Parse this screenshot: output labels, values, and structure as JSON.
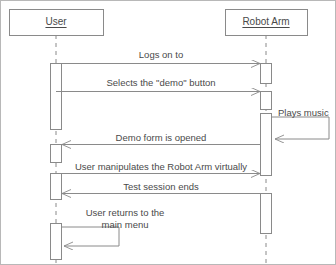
{
  "diagram": {
    "type": "uml-sequence-diagram",
    "colors": {
      "stroke": "#8a8a8a",
      "text": "#4a4a4a",
      "background": "#ffffff",
      "border": "#b8b8b8",
      "box_fill": "#ffffff"
    },
    "actors": [
      {
        "id": "user",
        "label": "User",
        "x": 55,
        "box": {
          "x": 8,
          "y": 8,
          "w": 94,
          "h": 26
        }
      },
      {
        "id": "robot_arm",
        "label": "Robot Arm",
        "x": 265,
        "box": {
          "x": 224,
          "y": 8,
          "w": 82,
          "h": 26
        }
      }
    ],
    "messages": [
      {
        "id": "m1",
        "label": "Logs on to",
        "from": "user",
        "to": "robot_arm",
        "direction": "right",
        "y": 62,
        "label_x": 160,
        "label_y": 48,
        "self": false
      },
      {
        "id": "m2",
        "label": "Selects the \"demo\" button",
        "from": "user",
        "to": "robot_arm",
        "direction": "right",
        "y": 90,
        "label_x": 160,
        "label_y": 76,
        "self": false
      },
      {
        "id": "m3",
        "label": "Plays music",
        "from": "robot_arm",
        "to": "robot_arm",
        "direction": "self",
        "y": 112,
        "label_x": 300,
        "label_y": 106,
        "self": true
      },
      {
        "id": "m4",
        "label": "Demo form is opened",
        "from": "robot_arm",
        "to": "user",
        "direction": "left",
        "y": 143,
        "label_x": 160,
        "label_y": 131,
        "self": false
      },
      {
        "id": "m5",
        "label": "User manipulates the Robot Arm virtually",
        "from": "user",
        "to": "robot_arm",
        "direction": "right",
        "y": 172,
        "label_x": 160,
        "label_y": 160,
        "self": false
      },
      {
        "id": "m6",
        "label": "Test session ends",
        "from": "robot_arm",
        "to": "user",
        "direction": "left",
        "y": 192,
        "label_x": 160,
        "label_y": 180,
        "self": false
      },
      {
        "id": "m7",
        "label_line_1": "User returns to the",
        "label_line_2": "main menu",
        "from": "user",
        "to": "user",
        "direction": "self",
        "y": 238,
        "label_x": 124,
        "label_y": 208,
        "self": true
      }
    ],
    "activations": {
      "user": [
        {
          "y": 62,
          "h": 66
        },
        {
          "y": 143,
          "h": 18
        },
        {
          "y": 172,
          "h": 26
        },
        {
          "y": 222,
          "h": 36
        }
      ],
      "robot_arm": [
        {
          "y": 62,
          "h": 20
        },
        {
          "y": 90,
          "h": 18
        },
        {
          "y": 112,
          "h": 62
        },
        {
          "y": 192,
          "h": 40
        }
      ]
    }
  }
}
